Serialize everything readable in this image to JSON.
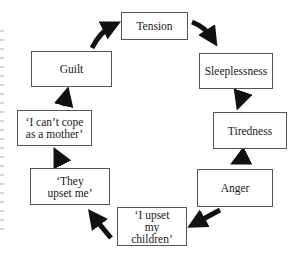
{
  "diagram": {
    "type": "cycle",
    "nodes": [
      {
        "id": "tension",
        "label": "Tension"
      },
      {
        "id": "sleeplessness",
        "label": "Sleeplessness"
      },
      {
        "id": "tiredness",
        "label": "Tiredness"
      },
      {
        "id": "anger",
        "label": "Anger"
      },
      {
        "id": "upset_children",
        "label": "‘I upset my children’"
      },
      {
        "id": "they_upset",
        "label": "‘They upset me’"
      },
      {
        "id": "cant_cope",
        "label": "‘I can’t cope as a mother’"
      },
      {
        "id": "guilt",
        "label": "Guilt"
      }
    ],
    "edges": [
      [
        "tension",
        "sleeplessness"
      ],
      [
        "sleeplessness",
        "tiredness"
      ],
      [
        "tiredness",
        "anger"
      ],
      [
        "anger",
        "upset_children"
      ],
      [
        "upset_children",
        "they_upset"
      ],
      [
        "they_upset",
        "cant_cope"
      ],
      [
        "cant_cope",
        "guilt"
      ],
      [
        "guilt",
        "tension"
      ]
    ],
    "colors": {
      "arrow": "#111111",
      "border": "#555555",
      "background": "#ffffff"
    }
  }
}
